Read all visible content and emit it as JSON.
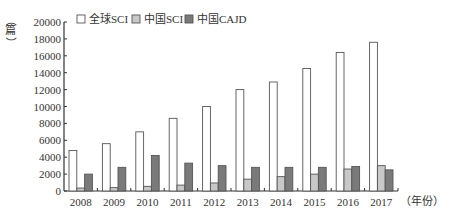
{
  "chart_data": {
    "type": "bar",
    "title": "",
    "xlabel": "（年份）",
    "ylabel": "（篇）",
    "ylim": [
      0,
      20000
    ],
    "yticks": [
      0,
      2000,
      4000,
      6000,
      8000,
      10000,
      12000,
      14000,
      16000,
      18000,
      20000
    ],
    "grid": false,
    "legend_position": "top-left",
    "categories": [
      "2008",
      "2009",
      "2010",
      "2011",
      "2012",
      "2013",
      "2014",
      "2015",
      "2016",
      "2017"
    ],
    "series": [
      {
        "name": "全球SCI",
        "color": "#ffffff",
        "values": [
          4800,
          5600,
          7000,
          8600,
          10000,
          12000,
          12900,
          14500,
          16400,
          17600
        ]
      },
      {
        "name": "中国SCI",
        "color": "#c8c8c8",
        "values": [
          350,
          400,
          550,
          700,
          950,
          1400,
          1700,
          2000,
          2600,
          3000
        ]
      },
      {
        "name": "中国CAJD",
        "color": "#7a7a7a",
        "values": [
          2000,
          2800,
          4200,
          3300,
          3000,
          2800,
          2800,
          2800,
          2900,
          2500
        ]
      }
    ]
  },
  "axis": {
    "y_unit_top": "（",
    "y_unit_char": "篇",
    "y_unit_bottom": "）",
    "x_unit": "（年份）"
  },
  "legend": [
    {
      "label": "全球SCI",
      "color": "#ffffff"
    },
    {
      "label": "中国SCI",
      "color": "#c8c8c8"
    },
    {
      "label": "中国CAJD",
      "color": "#7a7a7a"
    }
  ]
}
